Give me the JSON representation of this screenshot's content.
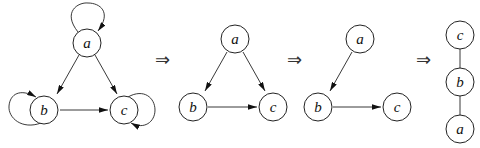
{
  "diagram": {
    "graphs": [
      {
        "id": "g1",
        "directed": true,
        "nodes": [
          {
            "id": "a",
            "label": "a",
            "x": 87,
            "y": 43
          },
          {
            "id": "b",
            "label": "b",
            "x": 42,
            "y": 110
          },
          {
            "id": "c",
            "label": "c",
            "x": 124,
            "y": 110
          }
        ],
        "edges": [
          {
            "from": "a",
            "to": "b"
          },
          {
            "from": "a",
            "to": "c"
          },
          {
            "from": "b",
            "to": "c"
          },
          {
            "from": "a",
            "to": "a",
            "self_loop": true
          },
          {
            "from": "b",
            "to": "b",
            "self_loop": true
          },
          {
            "from": "c",
            "to": "c",
            "self_loop": true
          }
        ]
      },
      {
        "id": "g2",
        "directed": true,
        "nodes": [
          {
            "id": "a",
            "label": "a",
            "x": 235,
            "y": 39
          },
          {
            "id": "b",
            "label": "b",
            "x": 193,
            "y": 107
          },
          {
            "id": "c",
            "label": "c",
            "x": 273,
            "y": 107
          }
        ],
        "edges": [
          {
            "from": "a",
            "to": "b"
          },
          {
            "from": "a",
            "to": "c"
          },
          {
            "from": "b",
            "to": "c"
          }
        ]
      },
      {
        "id": "g3",
        "directed": true,
        "nodes": [
          {
            "id": "a",
            "label": "a",
            "x": 360,
            "y": 39
          },
          {
            "id": "b",
            "label": "b",
            "x": 318,
            "y": 107
          },
          {
            "id": "c",
            "label": "c",
            "x": 397,
            "y": 107
          }
        ],
        "edges": [
          {
            "from": "a",
            "to": "b"
          },
          {
            "from": "b",
            "to": "c"
          }
        ]
      },
      {
        "id": "g4",
        "directed": false,
        "nodes": [
          {
            "id": "c",
            "label": "c",
            "x": 460,
            "y": 35
          },
          {
            "id": "b",
            "label": "b",
            "x": 460,
            "y": 82
          },
          {
            "id": "a",
            "label": "a",
            "x": 460,
            "y": 129
          }
        ],
        "edges": [
          {
            "from": "c",
            "to": "b"
          },
          {
            "from": "b",
            "to": "a"
          }
        ]
      }
    ],
    "transition_symbol": "⇒",
    "transitions": [
      {
        "symbol": "⇒",
        "x": 155,
        "y": 66
      },
      {
        "symbol": "⇒",
        "x": 287,
        "y": 66
      },
      {
        "symbol": "⇒",
        "x": 416,
        "y": 66
      }
    ]
  }
}
